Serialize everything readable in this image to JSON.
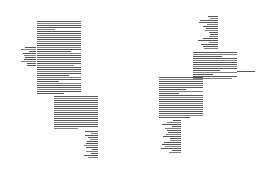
{
  "document": {
    "type": "two-page spread",
    "pages": [
      {
        "id": "left",
        "blocks": [
          {
            "name": "main-text-block",
            "x": 37,
            "y": 21,
            "w": 44,
            "h": 74,
            "align": "justify",
            "lines": 37
          },
          {
            "name": "side-note",
            "x": 19,
            "y": 47,
            "w": 17,
            "h": 21,
            "align": "right",
            "lines": 10
          },
          {
            "name": "continued-text-block",
            "x": 54,
            "y": 96,
            "w": 44,
            "h": 34,
            "align": "justify",
            "lines": 17
          },
          {
            "name": "right-aligned-list",
            "x": 80,
            "y": 131,
            "w": 18,
            "h": 29,
            "align": "right",
            "lines": 14
          }
        ]
      },
      {
        "id": "right",
        "blocks": [
          {
            "name": "right-aligned-list",
            "x": 196,
            "y": 16,
            "w": 22,
            "h": 36,
            "align": "right",
            "lines": 17
          },
          {
            "name": "main-text-block",
            "x": 193,
            "y": 52,
            "w": 44,
            "h": 29,
            "align": "justify",
            "lines": 14
          },
          {
            "name": "trailing-line",
            "x": 237,
            "y": 71,
            "w": 18,
            "h": 1,
            "align": "left",
            "lines": 1
          },
          {
            "name": "continued-text-block",
            "x": 159,
            "y": 77,
            "w": 44,
            "h": 43,
            "align": "justify",
            "lines": 21
          },
          {
            "name": "right-aligned-list",
            "x": 160,
            "y": 120,
            "w": 21,
            "h": 37,
            "align": "right",
            "lines": 17
          }
        ]
      }
    ],
    "text_legibility": "illegible at this resolution"
  }
}
